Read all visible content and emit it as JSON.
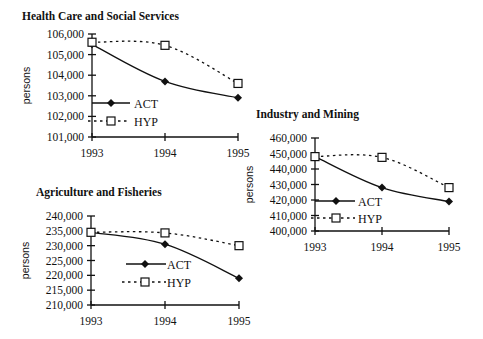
{
  "chart_data": [
    {
      "id": "health",
      "type": "line",
      "title": "Health Care and Social Services",
      "xlabel": "",
      "ylabel": "persons",
      "categories": [
        "1993",
        "1994",
        "1995"
      ],
      "ylim": [
        101000,
        106000
      ],
      "yticks": [
        101000,
        102000,
        103000,
        104000,
        105000,
        106000
      ],
      "ytick_labels": [
        "101,000",
        "102,000",
        "103,000",
        "104,000",
        "105,000",
        "106,000"
      ],
      "series": [
        {
          "name": "ACT",
          "marker": "filled-diamond",
          "line": "solid",
          "values": [
            105500,
            103700,
            102900
          ]
        },
        {
          "name": "HYP",
          "marker": "open-square",
          "line": "dotted",
          "values": [
            105600,
            105450,
            103600
          ]
        }
      ],
      "legend_position": "inside-left",
      "grid": false,
      "layout": {
        "x0": 92,
        "x2": 238,
        "yTop": 34,
        "yBottom": 137,
        "titleX": 22,
        "titleY": 20,
        "legend": {
          "actY": 103,
          "hypY": 121,
          "lineX0": 92,
          "lineX1": 130,
          "markerX": 111,
          "textX": 134
        }
      }
    },
    {
      "id": "industry",
      "type": "line",
      "title": "Industry and Mining",
      "xlabel": "",
      "ylabel": "persons",
      "categories": [
        "1993",
        "1994",
        "1995"
      ],
      "ylim": [
        400000,
        460000
      ],
      "yticks": [
        400000,
        410000,
        420000,
        430000,
        440000,
        450000,
        460000
      ],
      "ytick_labels": [
        "400,000",
        "410,000",
        "420,000",
        "430,000",
        "440,000",
        "450,000",
        "460,000"
      ],
      "series": [
        {
          "name": "ACT",
          "marker": "filled-diamond",
          "line": "solid",
          "values": [
            448000,
            428000,
            419000
          ]
        },
        {
          "name": "HYP",
          "marker": "open-square",
          "line": "dotted",
          "values": [
            448000,
            447500,
            428000
          ]
        }
      ],
      "legend_position": "inside-left",
      "grid": false,
      "layout": {
        "x0": 315,
        "x2": 449,
        "yTop": 138,
        "yBottom": 231,
        "titleX": 256,
        "titleY": 118,
        "legend": {
          "actY": 201,
          "hypY": 218,
          "lineX0": 315,
          "lineX1": 355,
          "markerX": 336,
          "textX": 358
        }
      }
    },
    {
      "id": "agriculture",
      "type": "line",
      "title": "Agriculture and Fisheries",
      "xlabel": "",
      "ylabel": "persons",
      "categories": [
        "1993",
        "1994",
        "1995"
      ],
      "ylim": [
        210000,
        240000
      ],
      "yticks": [
        210000,
        215000,
        220000,
        225000,
        230000,
        235000,
        240000
      ],
      "ytick_labels": [
        "210,000",
        "215,000",
        "220,000",
        "225,000",
        "230,000",
        "235,000",
        "240,000"
      ],
      "series": [
        {
          "name": "ACT",
          "marker": "filled-diamond",
          "line": "solid",
          "values": [
            234500,
            230500,
            219000
          ]
        },
        {
          "name": "HYP",
          "marker": "open-square",
          "line": "dotted",
          "values": [
            234500,
            234300,
            230000
          ]
        }
      ],
      "legend_position": "inside-center",
      "grid": false,
      "layout": {
        "x0": 91,
        "x2": 239,
        "yTop": 216,
        "yBottom": 305,
        "titleX": 36,
        "titleY": 196,
        "legend": {
          "actY": 264,
          "hypY": 282,
          "lineX0": 126,
          "lineX1": 166,
          "markerX": 145,
          "textX": 167
        }
      }
    }
  ]
}
